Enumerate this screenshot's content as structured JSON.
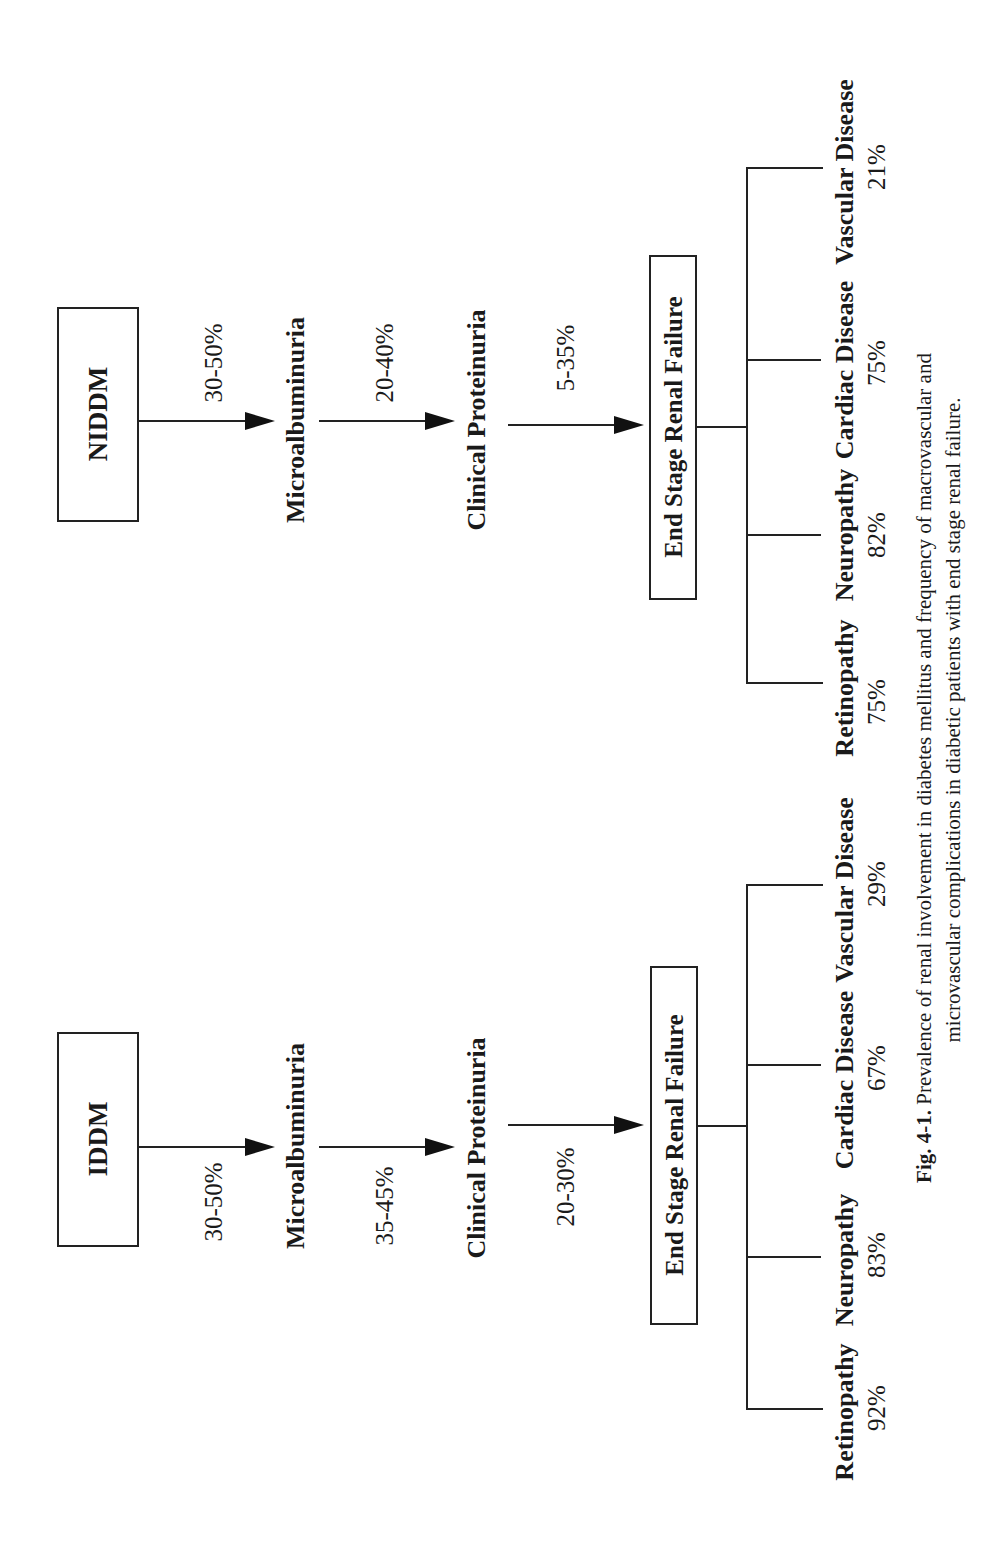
{
  "figure": {
    "caption_label": "Fig. 4-1.",
    "caption_line1": "Prevalence of renal involvement in diabetes mellitus and frequency of macrovascular and",
    "caption_line2": "microvascular complications in diabetic patients with end stage renal failure."
  },
  "panels": {
    "niddm": {
      "start": "NIDDM",
      "step1_pct": "30-50%",
      "stage1": "Microalbuminuria",
      "step2_pct": "20-40%",
      "stage2": "Clinical Proteinuria",
      "step3_pct": "5-35%",
      "stage3": "End Stage Renal Failure",
      "complications": [
        {
          "name": "Retinopathy",
          "value": "75%"
        },
        {
          "name": "Neuropathy",
          "value": "82%"
        },
        {
          "name": "Cardiac Disease",
          "value": "75%"
        },
        {
          "name": "Vascular Disease",
          "value": "21%"
        }
      ]
    },
    "iddm": {
      "start": "IDDM",
      "step1_pct": "30-50%",
      "stage1": "Microalbuminuria",
      "step2_pct": "35-45%",
      "stage2": "Clinical Proteinuria",
      "step3_pct": "20-30%",
      "stage3": "End Stage Renal Failure",
      "complications": [
        {
          "name": "Retinopathy",
          "value": "92%"
        },
        {
          "name": "Neuropathy",
          "value": "83%"
        },
        {
          "name": "Cardiac Disease",
          "value": "67%"
        },
        {
          "name": "Vascular Disease",
          "value": "29%"
        }
      ]
    }
  }
}
